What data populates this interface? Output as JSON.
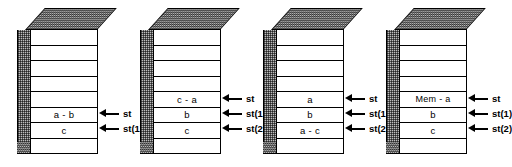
{
  "figure": {
    "title": "",
    "cells_per_stack": 8,
    "colors": {
      "outline": "#000000",
      "shaded_face": "#bdbdbd",
      "front_face": "#ffffff",
      "background": "#ffffff"
    },
    "arrow_icon": "left-arrow-icon",
    "stacks": [
      {
        "id": "stack-1",
        "cells": [
          "",
          "",
          "",
          "",
          "",
          "a - b",
          "c",
          ""
        ],
        "pointers": [
          {
            "label": "st",
            "cell_index": 5
          },
          {
            "label": "st(1)",
            "cell_index": 6
          }
        ]
      },
      {
        "id": "stack-2",
        "cells": [
          "",
          "",
          "",
          "",
          "c - a",
          "b",
          "c",
          ""
        ],
        "pointers": [
          {
            "label": "st",
            "cell_index": 4
          },
          {
            "label": "st(1)",
            "cell_index": 5
          },
          {
            "label": "st(2)",
            "cell_index": 6
          }
        ]
      },
      {
        "id": "stack-3",
        "cells": [
          "",
          "",
          "",
          "",
          "a",
          "b",
          "a - c",
          ""
        ],
        "pointers": [
          {
            "label": "st",
            "cell_index": 4
          },
          {
            "label": "st(1)",
            "cell_index": 5
          },
          {
            "label": "st(2)",
            "cell_index": 6
          }
        ]
      },
      {
        "id": "stack-4",
        "cells": [
          "",
          "",
          "",
          "",
          "Mem - a",
          "b",
          "c",
          ""
        ],
        "pointers": [
          {
            "label": "st",
            "cell_index": 4
          },
          {
            "label": "st(1)",
            "cell_index": 5
          },
          {
            "label": "st(2)",
            "cell_index": 6
          }
        ]
      }
    ]
  }
}
